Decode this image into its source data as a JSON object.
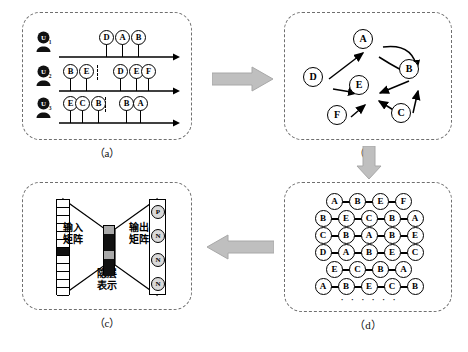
{
  "figure": {
    "captions": {
      "a": "（a）",
      "b": "（b）",
      "c": "（c）",
      "d": "（d）"
    },
    "arrow_colors": {
      "fill": "#bfbfbf",
      "stroke": "#9a9a9a"
    }
  },
  "panel_a": {
    "name": "user-session-sequences",
    "rows": [
      {
        "user": "U",
        "user_sub": "1",
        "segments": [
          {
            "items": []
          },
          {
            "items": [
              "D",
              "A",
              "B"
            ]
          }
        ]
      },
      {
        "user": "U",
        "user_sub": "2",
        "segments": [
          {
            "items": [
              "B",
              "E"
            ]
          },
          {
            "items": [
              "D",
              "E",
              "F"
            ]
          }
        ]
      },
      {
        "user": "U",
        "user_sub": "3",
        "segments": [
          {
            "items": [
              "E",
              "C",
              "B"
            ]
          },
          {
            "items": [
              "B",
              "A"
            ]
          }
        ]
      }
    ]
  },
  "panel_b": {
    "name": "session-graph",
    "nodes": [
      {
        "id": "A",
        "x": 78,
        "y": 26
      },
      {
        "id": "B",
        "x": 124,
        "y": 56
      },
      {
        "id": "D",
        "x": 28,
        "y": 64
      },
      {
        "id": "E",
        "x": 74,
        "y": 72
      },
      {
        "id": "F",
        "x": 52,
        "y": 102
      },
      {
        "id": "C",
        "x": 116,
        "y": 100
      }
    ],
    "edges": [
      {
        "from": "A",
        "to": "B",
        "curve": "up"
      },
      {
        "from": "A",
        "to": "B",
        "curve": "down"
      },
      {
        "from": "D",
        "to": "A",
        "curve": "none"
      },
      {
        "from": "D",
        "to": "E",
        "curve": "none"
      },
      {
        "from": "B",
        "to": "E",
        "curve": "none"
      },
      {
        "from": "F",
        "to": "E",
        "curve": "none"
      },
      {
        "from": "C",
        "to": "E",
        "curve": "none"
      },
      {
        "from": "C",
        "to": "B",
        "curve": "none"
      }
    ]
  },
  "panel_c": {
    "name": "skip-gram-network",
    "labels": {
      "input_matrix": "输入\n矩阵",
      "input_matrix_line1": "输入",
      "input_matrix_line2": "矩阵",
      "output_matrix_line1": "输出",
      "output_matrix_line2": "矩阵",
      "hidden_line1": "隐层",
      "hidden_line2": "表示"
    },
    "input_vector": {
      "cells": 12,
      "active_index": 6
    },
    "hidden_vector": {
      "cells": 6,
      "pattern": [
        "gray",
        "black",
        "black",
        "gray",
        "black",
        "black"
      ]
    },
    "output_nodes": [
      "P",
      "N",
      "N",
      "N"
    ]
  },
  "panel_d": {
    "name": "random-walk-sequences",
    "walks": [
      [
        "A",
        "B",
        "E",
        "F"
      ],
      [
        "B",
        "E",
        "C",
        "B",
        "A"
      ],
      [
        "C",
        "B",
        "A",
        "B",
        "E"
      ],
      [
        "D",
        "A",
        "B",
        "E",
        "C"
      ],
      [
        "E",
        "C",
        "B",
        "A"
      ],
      [
        "A",
        "B",
        "E",
        "C",
        "B"
      ]
    ],
    "ellipsis": "· · · · · ·"
  }
}
